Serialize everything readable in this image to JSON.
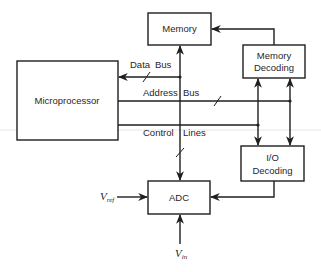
{
  "diagram": {
    "blocks": {
      "microprocessor": {
        "label": "Microprocessor"
      },
      "memory": {
        "label": "Memory"
      },
      "memory_decoding": {
        "line1": "Memory",
        "line2": "Decoding"
      },
      "io_decoding": {
        "line1": "I/O",
        "line2": "Decoding"
      },
      "adc": {
        "label": "ADC"
      }
    },
    "buses": {
      "data_bus": {
        "word1": "Data",
        "word2": "Bus"
      },
      "address_bus": {
        "word1": "Address",
        "word2": "Bus"
      },
      "control_lines": {
        "word1": "Control",
        "word2": "Lines"
      }
    },
    "signals": {
      "vref": {
        "main": "V",
        "sub": "ref"
      },
      "vin": {
        "main": "V",
        "sub": "in"
      }
    },
    "colors": {
      "line": "#1f1f1f",
      "background": "#ffffff",
      "artifact": "#e6e6e6"
    }
  }
}
